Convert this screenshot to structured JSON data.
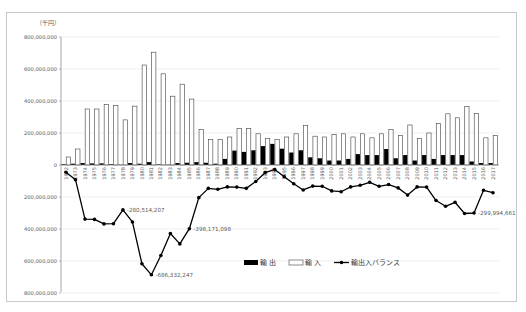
{
  "chart_data": {
    "type": "bar",
    "title": "",
    "unit_label": "（千円）",
    "xlabel": "",
    "ylabel": "（千円）",
    "ylim": [
      -800000000,
      800000000
    ],
    "yticks": [
      800000000,
      600000000,
      400000000,
      200000000,
      0,
      -200000000,
      -400000000,
      -600000000,
      -800000000
    ],
    "ytick_labels": [
      "800,000,000",
      "600,000,000",
      "400,000,000",
      "200,000,000",
      "0",
      "200,000,000",
      "400,000,000",
      "600,000,000",
      "800,000,000"
    ],
    "grid": true,
    "legend_position": "bottom-right",
    "categories": [
      "1972",
      "1973",
      "1974",
      "1975",
      "1976",
      "1977",
      "1978",
      "1979",
      "1980",
      "1981",
      "1982",
      "1983",
      "1984",
      "1985",
      "1986",
      "1987",
      "1988",
      "1989",
      "1990",
      "1991",
      "1992",
      "1993",
      "1994",
      "1995",
      "1996",
      "1997",
      "1998",
      "1999",
      "2000",
      "2001",
      "2002",
      "2003",
      "2004",
      "2005",
      "2006",
      "2007",
      "2008",
      "2009",
      "2010",
      "2011",
      "2012",
      "2013",
      "2014",
      "2015",
      "2016",
      "2017"
    ],
    "series": [
      {
        "name": "輸 出",
        "type": "bar",
        "style": "filled-black",
        "values": [
          5000000,
          8000000,
          12000000,
          10000000,
          10000000,
          5000000,
          2000000,
          12000000,
          8000000,
          18000000,
          4000000,
          2000000,
          12000000,
          14000000,
          18000000,
          14000000,
          8000000,
          38000000,
          90000000,
          82000000,
          92000000,
          118000000,
          132000000,
          102000000,
          78000000,
          92000000,
          48000000,
          42000000,
          28000000,
          28000000,
          38000000,
          68000000,
          62000000,
          62000000,
          100000000,
          42000000,
          62000000,
          28000000,
          62000000,
          38000000,
          62000000,
          62000000,
          62000000,
          22000000,
          12000000,
          12000000
        ]
      },
      {
        "name": "輸 入",
        "type": "bar",
        "style": "outline-white",
        "values": [
          50000000,
          100000000,
          350000000,
          350000000,
          378000000,
          372000000,
          282000000,
          368000000,
          625000000,
          705000000,
          570000000,
          430000000,
          505000000,
          412000000,
          222000000,
          160000000,
          160000000,
          175000000,
          228000000,
          228000000,
          195000000,
          165000000,
          160000000,
          175000000,
          195000000,
          248000000,
          180000000,
          175000000,
          190000000,
          195000000,
          175000000,
          195000000,
          170000000,
          195000000,
          222000000,
          185000000,
          250000000,
          165000000,
          200000000,
          260000000,
          320000000,
          295000000,
          365000000,
          322000000,
          170000000,
          185000000
        ]
      },
      {
        "name": "輸出入バランス",
        "type": "line",
        "marker": "circle",
        "values": [
          -45000000,
          -92000000,
          -338000000,
          -340000000,
          -368000000,
          -367000000,
          -280514207,
          -356000000,
          -617000000,
          -686332247,
          -566000000,
          -428000000,
          -493000000,
          -398171098,
          -204000000,
          -146000000,
          -152000000,
          -137000000,
          -138000000,
          -146000000,
          -103000000,
          -47000000,
          -28000000,
          -73000000,
          -117000000,
          -156000000,
          -132000000,
          -133000000,
          -162000000,
          -167000000,
          -137000000,
          -127000000,
          -108000000,
          -133000000,
          -122000000,
          -143000000,
          -188000000,
          -137000000,
          -138000000,
          -222000000,
          -258000000,
          -233000000,
          -303000000,
          -299994661,
          -158000000,
          -173000000
        ]
      }
    ],
    "annotations": [
      {
        "category": "1978",
        "text": "-280,514,207"
      },
      {
        "category": "1981",
        "text": "-686,332,247"
      },
      {
        "category": "1985",
        "text": "-398,171,098"
      },
      {
        "category": "2015",
        "text": "-299,994,661"
      }
    ]
  },
  "legend": {
    "export_label": "輸 出",
    "import_label": "輸 入",
    "balance_label": "輸出入バランス"
  }
}
